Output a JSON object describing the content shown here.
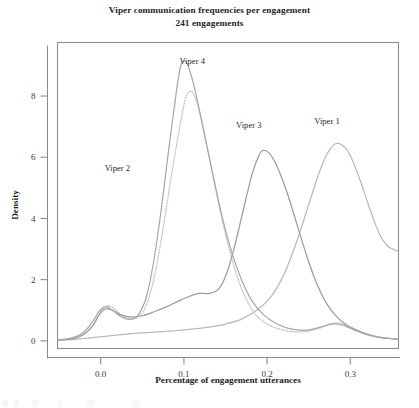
{
  "chart_data": {
    "type": "line",
    "title": "Viper communication frequencies per engagement",
    "subtitle": "241 engagements",
    "xlabel": "Percentage of engagement utterances",
    "ylabel": "Density",
    "xlim": [
      -0.052,
      0.358
    ],
    "ylim": [
      -0.25,
      9.75
    ],
    "xticks": [
      0.0,
      0.1,
      0.2,
      0.3
    ],
    "xtick_labels": [
      "0.0",
      "0.1",
      "0.2",
      "0.3"
    ],
    "yticks": [
      0,
      2,
      4,
      6,
      8
    ],
    "ytick_labels": [
      "0",
      "2",
      "4",
      "6",
      "8"
    ],
    "grid": false,
    "legend": "inline-annotations",
    "series": [
      {
        "name": "Viper 1",
        "style": "solid",
        "color": "#b9b9b9",
        "peak_x": 0.283,
        "peak_y": 6.45,
        "label_x": 0.272,
        "label_y": 7.1,
        "points": [
          [
            -0.052,
            0.02
          ],
          [
            -0.03,
            0.05
          ],
          [
            -0.01,
            0.1
          ],
          [
            0.01,
            0.16
          ],
          [
            0.03,
            0.22
          ],
          [
            0.05,
            0.26
          ],
          [
            0.07,
            0.29
          ],
          [
            0.09,
            0.33
          ],
          [
            0.11,
            0.38
          ],
          [
            0.13,
            0.45
          ],
          [
            0.15,
            0.55
          ],
          [
            0.17,
            0.72
          ],
          [
            0.19,
            1.05
          ],
          [
            0.205,
            1.45
          ],
          [
            0.22,
            2.15
          ],
          [
            0.235,
            3.2
          ],
          [
            0.25,
            4.45
          ],
          [
            0.262,
            5.45
          ],
          [
            0.272,
            6.1
          ],
          [
            0.283,
            6.45
          ],
          [
            0.295,
            6.28
          ],
          [
            0.305,
            5.75
          ],
          [
            0.315,
            5.0
          ],
          [
            0.325,
            4.2
          ],
          [
            0.335,
            3.5
          ],
          [
            0.345,
            3.1
          ],
          [
            0.358,
            2.92
          ]
        ]
      },
      {
        "name": "Viper 2",
        "style": "dotted",
        "color": "#c3c3c3",
        "peak_x": 0.105,
        "peak_y": 8.12,
        "label_x": 0.02,
        "label_y": 5.55,
        "points": [
          [
            -0.052,
            0.03
          ],
          [
            -0.035,
            0.08
          ],
          [
            -0.02,
            0.22
          ],
          [
            -0.008,
            0.55
          ],
          [
            0.0,
            0.95
          ],
          [
            0.008,
            1.15
          ],
          [
            0.016,
            1.05
          ],
          [
            0.026,
            0.82
          ],
          [
            0.036,
            0.72
          ],
          [
            0.046,
            0.8
          ],
          [
            0.056,
            1.25
          ],
          [
            0.066,
            2.3
          ],
          [
            0.076,
            3.85
          ],
          [
            0.085,
            5.4
          ],
          [
            0.094,
            6.85
          ],
          [
            0.1,
            7.7
          ],
          [
            0.105,
            8.12
          ],
          [
            0.112,
            8.05
          ],
          [
            0.12,
            7.35
          ],
          [
            0.13,
            6.05
          ],
          [
            0.142,
            4.45
          ],
          [
            0.154,
            3.05
          ],
          [
            0.166,
            1.95
          ],
          [
            0.178,
            1.2
          ],
          [
            0.19,
            0.75
          ],
          [
            0.205,
            0.48
          ],
          [
            0.225,
            0.32
          ],
          [
            0.245,
            0.3
          ],
          [
            0.262,
            0.4
          ],
          [
            0.275,
            0.55
          ],
          [
            0.288,
            0.58
          ],
          [
            0.3,
            0.45
          ],
          [
            0.315,
            0.28
          ],
          [
            0.33,
            0.16
          ],
          [
            0.345,
            0.09
          ],
          [
            0.358,
            0.06
          ]
        ]
      },
      {
        "name": "Viper 3",
        "style": "solid",
        "color": "#9c9c9c",
        "peak_x": 0.195,
        "peak_y": 6.22,
        "label_x": 0.178,
        "label_y": 6.95,
        "points": [
          [
            -0.052,
            0.02
          ],
          [
            -0.035,
            0.06
          ],
          [
            -0.022,
            0.18
          ],
          [
            -0.01,
            0.48
          ],
          [
            -0.002,
            0.85
          ],
          [
            0.006,
            1.05
          ],
          [
            0.014,
            1.0
          ],
          [
            0.024,
            0.85
          ],
          [
            0.036,
            0.78
          ],
          [
            0.05,
            0.82
          ],
          [
            0.064,
            0.95
          ],
          [
            0.078,
            1.1
          ],
          [
            0.092,
            1.28
          ],
          [
            0.106,
            1.45
          ],
          [
            0.118,
            1.55
          ],
          [
            0.13,
            1.55
          ],
          [
            0.142,
            1.7
          ],
          [
            0.152,
            2.25
          ],
          [
            0.162,
            3.2
          ],
          [
            0.172,
            4.35
          ],
          [
            0.182,
            5.45
          ],
          [
            0.19,
            6.05
          ],
          [
            0.195,
            6.22
          ],
          [
            0.202,
            6.15
          ],
          [
            0.212,
            5.7
          ],
          [
            0.224,
            4.85
          ],
          [
            0.236,
            3.8
          ],
          [
            0.248,
            2.75
          ],
          [
            0.26,
            1.85
          ],
          [
            0.272,
            1.2
          ],
          [
            0.285,
            0.75
          ],
          [
            0.3,
            0.45
          ],
          [
            0.315,
            0.26
          ],
          [
            0.33,
            0.14
          ],
          [
            0.345,
            0.08
          ],
          [
            0.358,
            0.05
          ]
        ]
      },
      {
        "name": "Viper 4",
        "style": "solid",
        "color": "#a8a8a8",
        "peak_x": 0.098,
        "peak_y": 9.12,
        "label_x": 0.11,
        "label_y": 9.05,
        "points": [
          [
            -0.052,
            0.03
          ],
          [
            -0.036,
            0.09
          ],
          [
            -0.022,
            0.25
          ],
          [
            -0.01,
            0.62
          ],
          [
            -0.001,
            1.0
          ],
          [
            0.007,
            1.12
          ],
          [
            0.015,
            0.98
          ],
          [
            0.025,
            0.78
          ],
          [
            0.035,
            0.7
          ],
          [
            0.045,
            0.85
          ],
          [
            0.055,
            1.45
          ],
          [
            0.064,
            2.65
          ],
          [
            0.073,
            4.35
          ],
          [
            0.081,
            6.1
          ],
          [
            0.089,
            7.75
          ],
          [
            0.094,
            8.7
          ],
          [
            0.098,
            9.12
          ],
          [
            0.104,
            9.05
          ],
          [
            0.112,
            8.35
          ],
          [
            0.122,
            7.1
          ],
          [
            0.134,
            5.55
          ],
          [
            0.146,
            4.05
          ],
          [
            0.158,
            2.85
          ],
          [
            0.17,
            1.95
          ],
          [
            0.182,
            1.3
          ],
          [
            0.196,
            0.85
          ],
          [
            0.212,
            0.55
          ],
          [
            0.23,
            0.38
          ],
          [
            0.248,
            0.35
          ],
          [
            0.264,
            0.45
          ],
          [
            0.278,
            0.55
          ],
          [
            0.29,
            0.52
          ],
          [
            0.305,
            0.35
          ],
          [
            0.32,
            0.2
          ],
          [
            0.338,
            0.1
          ],
          [
            0.358,
            0.06
          ]
        ]
      }
    ]
  }
}
